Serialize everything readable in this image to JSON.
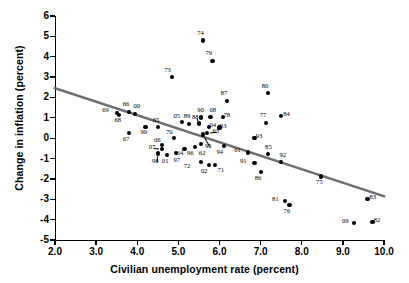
{
  "chart_data": {
    "type": "scatter",
    "title": "",
    "xlabel": "Civilian unemployment rate (percent)",
    "ylabel": "Change in inflation (percent)",
    "xlim": [
      2.0,
      10.0
    ],
    "ylim": [
      -5,
      6
    ],
    "xticks": [
      "2.0",
      "3.0",
      "4.0",
      "5.0",
      "6.0",
      "7.0",
      "8.0",
      "9.0",
      "10.0"
    ],
    "xtick_values": [
      2.0,
      3.0,
      4.0,
      5.0,
      6.0,
      7.0,
      8.0,
      9.0,
      10.0
    ],
    "yticks": [
      "6",
      "5",
      "4",
      "3",
      "2",
      "1",
      "0",
      "-1",
      "-2",
      "-3",
      "-4",
      "-5"
    ],
    "ytick_values": [
      6,
      5,
      4,
      3,
      2,
      1,
      0,
      -1,
      -2,
      -3,
      -4,
      -5
    ],
    "grid": false,
    "legend": false,
    "point_color": "#000000",
    "trendline": {
      "color": "#6e6e6e",
      "x": [
        2.0,
        10.0
      ],
      "y": [
        2.45,
        -2.85
      ]
    },
    "points": [
      {
        "label": "61",
        "x": 6.7,
        "y": -0.7,
        "lx": 6.48,
        "ly": -0.62
      },
      {
        "label": "62",
        "x": 5.55,
        "y": -0.3,
        "lx": 5.62,
        "ly": -0.8
      },
      {
        "label": "63",
        "x": 5.7,
        "y": 0.25,
        "lx": 5.95,
        "ly": 0.3,
        "leader": true
      },
      {
        "label": "64",
        "x": 5.15,
        "y": -0.52,
        "lx": 5.08,
        "ly": -0.8
      },
      {
        "label": "65",
        "x": 4.5,
        "y": 0.55,
        "lx": 4.5,
        "ly": 0.85
      },
      {
        "label": "66",
        "x": 3.8,
        "y": 1.3,
        "lx": 3.77,
        "ly": 1.62
      },
      {
        "label": "67",
        "x": 3.8,
        "y": 0.25,
        "lx": 3.77,
        "ly": -0.08
      },
      {
        "label": "68",
        "x": 3.55,
        "y": 1.15,
        "lx": 3.57,
        "ly": 0.82
      },
      {
        "label": "69",
        "x": 3.5,
        "y": 1.22,
        "lx": 3.27,
        "ly": 1.33
      },
      {
        "label": "70",
        "x": 4.9,
        "y": 0.0,
        "lx": 4.82,
        "ly": 0.26
      },
      {
        "label": "71",
        "x": 5.9,
        "y": -1.32,
        "lx": 6.07,
        "ly": -1.62
      },
      {
        "label": "72",
        "x": 5.55,
        "y": -1.18,
        "lx": 5.25,
        "ly": -1.42
      },
      {
        "label": "73",
        "x": 4.85,
        "y": 3.0,
        "lx": 4.78,
        "ly": 3.32
      },
      {
        "label": "74",
        "x": 5.6,
        "y": 4.8,
        "lx": 5.58,
        "ly": 5.12
      },
      {
        "label": "75",
        "x": 8.47,
        "y": -1.88,
        "lx": 8.47,
        "ly": -2.22
      },
      {
        "label": "76",
        "x": 7.7,
        "y": -3.3,
        "lx": 7.68,
        "ly": -3.62
      },
      {
        "label": "77",
        "x": 7.13,
        "y": 0.75,
        "lx": 7.1,
        "ly": 1.08
      },
      {
        "label": "78",
        "x": 6.08,
        "y": 1.05,
        "lx": 6.22,
        "ly": 1.1
      },
      {
        "label": "79",
        "x": 5.83,
        "y": 3.8,
        "lx": 5.78,
        "ly": 4.12
      },
      {
        "label": "80",
        "x": 7.18,
        "y": 2.2,
        "lx": 7.15,
        "ly": 2.52
      },
      {
        "label": "81",
        "x": 7.6,
        "y": -3.1,
        "lx": 7.4,
        "ly": -3.05
      },
      {
        "label": "82",
        "x": 9.72,
        "y": -4.1,
        "lx": 9.87,
        "ly": -4.05
      },
      {
        "label": "83",
        "x": 9.6,
        "y": -2.98,
        "lx": 9.77,
        "ly": -2.92
      },
      {
        "label": "84",
        "x": 7.5,
        "y": 1.1,
        "lx": 7.67,
        "ly": 1.15
      },
      {
        "label": "85",
        "x": 7.18,
        "y": -0.78,
        "lx": 7.23,
        "ly": -0.48
      },
      {
        "label": "86",
        "x": 7.0,
        "y": -1.68,
        "lx": 6.98,
        "ly": -2.02
      },
      {
        "label": "87",
        "x": 6.18,
        "y": 1.83,
        "lx": 6.15,
        "ly": 2.15
      },
      {
        "label": "88",
        "x": 5.5,
        "y": 0.72,
        "lx": 5.45,
        "ly": 0.98,
        "leader": true
      },
      {
        "label": "89",
        "x": 5.25,
        "y": 0.7,
        "lx": 5.25,
        "ly": 1.05
      },
      {
        "label": "90",
        "x": 5.55,
        "y": 1.02,
        "lx": 5.58,
        "ly": 1.33
      },
      {
        "label": "91",
        "x": 6.85,
        "y": -1.2,
        "lx": 6.62,
        "ly": -1.15
      },
      {
        "label": "92",
        "x": 7.5,
        "y": -1.18,
        "lx": 7.58,
        "ly": -0.88
      },
      {
        "label": "93",
        "x": 6.85,
        "y": 0.0,
        "lx": 7.0,
        "ly": 0.05
      },
      {
        "label": "94",
        "x": 6.1,
        "y": -0.4,
        "lx": 6.05,
        "ly": -0.72
      },
      {
        "label": "96",
        "x": 5.4,
        "y": -0.45,
        "lx": 5.33,
        "ly": -0.78
      },
      {
        "label": "97",
        "x": 4.95,
        "y": -0.72,
        "lx": 5.0,
        "ly": -1.12
      },
      {
        "label": "98",
        "x": 4.5,
        "y": -0.75,
        "lx": 4.48,
        "ly": -1.18,
        "leader": true
      },
      {
        "label": "99",
        "x": 4.2,
        "y": 0.55,
        "lx": 4.2,
        "ly": 0.25
      },
      {
        "label": "00",
        "x": 3.95,
        "y": 1.2,
        "lx": 4.03,
        "ly": 1.52
      },
      {
        "label": "01",
        "x": 4.73,
        "y": -0.82,
        "lx": 4.72,
        "ly": -1.18
      },
      {
        "label": "02",
        "x": 5.75,
        "y": -1.32,
        "lx": 5.67,
        "ly": -1.65
      },
      {
        "label": "03",
        "x": 6.0,
        "y": 0.52,
        "lx": 6.13,
        "ly": 0.56
      },
      {
        "label": "04",
        "x": 5.75,
        "y": 0.55,
        "lx": 5.88,
        "ly": 0.6
      },
      {
        "label": "05",
        "x": 5.08,
        "y": 0.78,
        "lx": 5.0,
        "ly": 1.05
      },
      {
        "label": "06",
        "x": 4.6,
        "y": -0.35,
        "lx": 4.53,
        "ly": -0.12
      },
      {
        "label": "07",
        "x": 4.6,
        "y": -0.52,
        "lx": 4.4,
        "ly": -0.48,
        "leader": true
      },
      {
        "label": "08",
        "x": 5.78,
        "y": 1.05,
        "lx": 5.88,
        "ly": 1.33
      },
      {
        "label": "09",
        "x": 9.28,
        "y": -4.15,
        "lx": 9.1,
        "ly": -4.1
      },
      {
        "label": "95",
        "x": 5.6,
        "y": 0.18,
        "lx": 5.77,
        "ly": -0.42,
        "leader": true
      }
    ]
  }
}
